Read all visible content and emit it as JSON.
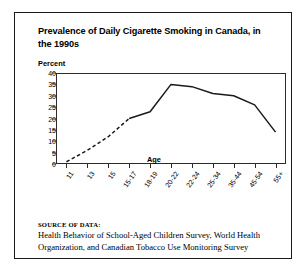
{
  "figure": {
    "title": "Prevalence of Daily Cigarette Smoking in Canada, in the 1990s",
    "source_heading": "SOURCE OF DATA:",
    "source_text": "Health Behavior of School-Aged Children Survey, World Health Organization, and Canadian Tobacco Use Monitoring Survey"
  },
  "chart_data": {
    "type": "line",
    "title": "Prevalence of Daily Cigarette Smoking in Canada, in the 1990s",
    "xlabel": "Age",
    "ylabel": "Percent",
    "ylim": [
      0,
      40
    ],
    "yticks": [
      0,
      5,
      10,
      15,
      20,
      25,
      30,
      35,
      40
    ],
    "grid": false,
    "legend": "none",
    "categories": [
      "11",
      "13",
      "15",
      "15-17",
      "18-19",
      "20-22",
      "22-24",
      "25-34",
      "35-44",
      "45-54",
      "55+"
    ],
    "values": [
      1,
      6,
      12,
      20,
      23,
      35,
      34,
      31,
      30,
      26,
      14
    ],
    "series": [
      {
        "name": "Daily smoking prevalence",
        "values": [
          1,
          6,
          12,
          20,
          23,
          35,
          34,
          31,
          30,
          26,
          14
        ],
        "style_segments": [
          {
            "style": "dashed",
            "from_index": 0,
            "to_index": 3
          },
          {
            "style": "solid",
            "from_index": 3,
            "to_index": 10
          }
        ],
        "color": "#1a1a1a"
      }
    ]
  }
}
